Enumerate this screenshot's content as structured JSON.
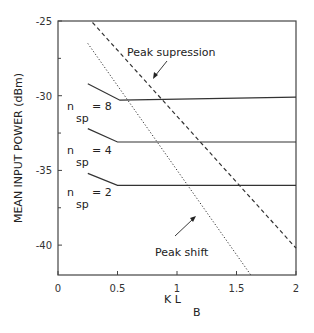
{
  "chart_data": {
    "type": "line",
    "title": "",
    "xlabel": "K L",
    "xlabel_subscript": "B",
    "ylabel": "MEAN INPUT POWER (dBm)",
    "xlim": [
      0,
      2
    ],
    "ylim": [
      -42,
      -25
    ],
    "x_ticks": [
      0,
      0.5,
      1,
      1.5,
      2
    ],
    "x_tick_labels": [
      "0",
      "0.5",
      "1",
      "1.5",
      "2"
    ],
    "y_ticks": [
      -25,
      -30,
      -35,
      -40
    ],
    "y_tick_labels": [
      "-25",
      "-30",
      "-35",
      "-40"
    ],
    "y_minor_ticks": [
      -27.5,
      -32.5,
      -37.5
    ],
    "grid": false,
    "series": [
      {
        "name": "n_sp = 8",
        "label_main": "n",
        "label_sub": "sp",
        "label_value": "= 8",
        "style": "solid",
        "x": [
          0.25,
          0.52,
          2.0
        ],
        "y": [
          -29.2,
          -30.3,
          -30.1
        ]
      },
      {
        "name": "n_sp = 4",
        "label_main": "n",
        "label_sub": "sp",
        "label_value": "= 4",
        "style": "solid",
        "x": [
          0.25,
          0.5,
          2.0
        ],
        "y": [
          -32.2,
          -33.1,
          -33.1
        ]
      },
      {
        "name": "n_sp = 2",
        "label_main": "n",
        "label_sub": "sp",
        "label_value": "= 2",
        "style": "solid",
        "x": [
          0.25,
          0.5,
          2.0
        ],
        "y": [
          -35.2,
          -36.0,
          -36.0
        ]
      },
      {
        "name": "Peak supression",
        "style": "dashed",
        "x": [
          0.29,
          2.0
        ],
        "y": [
          -25.1,
          -40.2
        ]
      },
      {
        "name": "Peak shift",
        "style": "dotted",
        "x": [
          0.25,
          1.62
        ],
        "y": [
          -26.5,
          -42.0
        ]
      }
    ],
    "annotations": [
      {
        "text": "Peak supression",
        "target": "dashed line"
      },
      {
        "text": "Peak shift",
        "target": "dotted line"
      }
    ]
  }
}
